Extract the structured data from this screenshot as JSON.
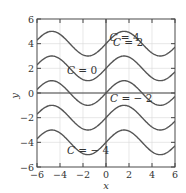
{
  "chart_data": {
    "type": "line",
    "title": "",
    "xlabel": "x",
    "ylabel": "y",
    "xlim": [
      -6,
      6
    ],
    "ylim": [
      -6,
      6
    ],
    "grid": true,
    "legend": "inline labels",
    "x_ticks": [
      -6,
      -4,
      -2,
      0,
      2,
      4,
      6
    ],
    "y_ticks": [
      -6,
      -4,
      -2,
      0,
      2,
      4,
      6
    ],
    "x_tick_labels": [
      "−6",
      "−4",
      "−2",
      "0",
      "2",
      "4",
      "6"
    ],
    "y_tick_labels": [
      "−6",
      "−4",
      "−2",
      "0",
      "2",
      "4",
      "6"
    ],
    "function": "y = sin(x) + C",
    "series": [
      {
        "name": "C = 4",
        "C": 4,
        "label_var": "C",
        "label_val": " = 4"
      },
      {
        "name": "C = 2",
        "C": 2,
        "label_var": "C",
        "label_val": " = 2"
      },
      {
        "name": "C = 0",
        "C": 0,
        "label_var": "C",
        "label_val": " = 0"
      },
      {
        "name": "C = −2",
        "C": -2,
        "label_var": "C",
        "label_val": " = − 2"
      },
      {
        "name": "C = −4",
        "C": -4,
        "label_var": "C",
        "label_val": " = − 4"
      }
    ],
    "annotations": [
      {
        "series": "C = 4",
        "x": 0.3,
        "y": 4.25
      },
      {
        "series": "C = 2",
        "x": 0.6,
        "y": 3.8
      },
      {
        "series": "C = 0",
        "x": -3.4,
        "y": 1.55
      },
      {
        "series": "C = −2",
        "x": 0.35,
        "y": -0.7
      },
      {
        "series": "C = −4",
        "x": -3.4,
        "y": -4.95
      }
    ],
    "colors": {
      "curve": "#555555",
      "grid": "#d9d9d9",
      "axis": "#444444",
      "frame": "#555555"
    }
  }
}
